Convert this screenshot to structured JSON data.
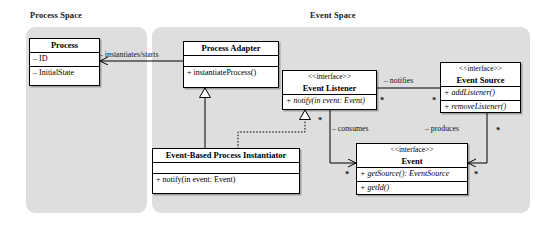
{
  "diagram": {
    "background": "#ffffff",
    "panel_color": "#dedede",
    "line_color": "#000000"
  },
  "panels": [
    {
      "id": "process-space",
      "label": "Process Space"
    },
    {
      "id": "event-space",
      "label": "Event Space"
    }
  ],
  "classes": {
    "process": {
      "name": "Process",
      "attributes": [
        "– ID",
        "– InitialState"
      ]
    },
    "process_adapter": {
      "name": "Process Adapter",
      "attributes": [],
      "operations": [
        "+ instantiateProcess()"
      ]
    },
    "event_listener": {
      "stereotype": "<<interface>>",
      "name": "Event Listener",
      "operations": [
        "+ notify(in event: Event)"
      ]
    },
    "event_source": {
      "stereotype": "<<interface>>",
      "name": "Event Source",
      "operations": [
        "+ addListener()",
        "+ removeListener()"
      ]
    },
    "event": {
      "stereotype": "<<interface>>",
      "name": "Event",
      "operations": [
        "+ getSource(): EventSource",
        "+ getId()"
      ]
    },
    "instantiator": {
      "name": "Event-Based Process Instantiator",
      "attributes": [],
      "operations": [
        "+ notify(in event: Event)"
      ]
    }
  },
  "relations": {
    "instantiates": {
      "label": "– instantiates/starts"
    },
    "notifies": {
      "label": "– notifies",
      "source_mult": "*",
      "target_mult": "*"
    },
    "consumes": {
      "label": "– consumes",
      "mult": "*"
    },
    "produces": {
      "label": "– produces",
      "source_mult": "*",
      "target_mult": "*"
    },
    "realizes_mult": {
      "mult": "*"
    }
  }
}
